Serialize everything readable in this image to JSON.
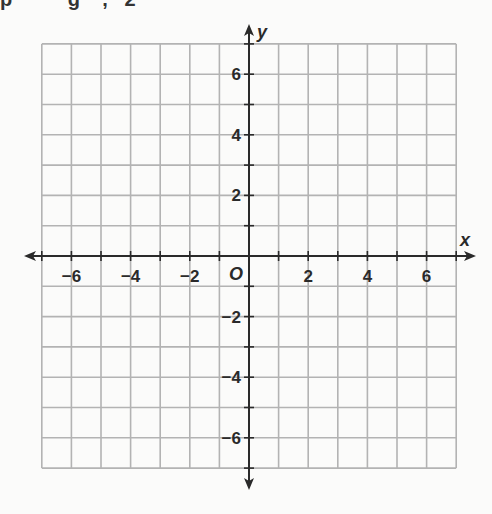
{
  "top_text_fragment": "p          g    ,   2",
  "diagram": {
    "type": "coordinate-plane",
    "x_axis_label": "x",
    "y_axis_label": "y",
    "origin_label": "O",
    "x_range": [
      -7,
      7
    ],
    "y_range": [
      -7,
      7
    ],
    "grid_step": 1,
    "x_tick_labels": [
      "-6",
      "-4",
      "-2",
      "2",
      "4",
      "6"
    ],
    "x_tick_values": [
      -6,
      -4,
      -2,
      2,
      4,
      6
    ],
    "y_tick_labels": [
      "6",
      "4",
      "2",
      "-2",
      "-4",
      "-6"
    ],
    "y_tick_values": [
      6,
      4,
      2,
      -2,
      -4,
      -6
    ],
    "colors": {
      "grid": "#b3b3b3",
      "axis": "#2a2a2a",
      "background": "#fbfbfa"
    }
  }
}
